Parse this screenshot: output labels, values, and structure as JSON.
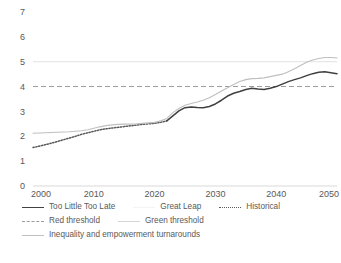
{
  "chart_data": {
    "type": "line",
    "title": "",
    "xlabel": "",
    "ylabel": "",
    "xlim": [
      2000,
      2050
    ],
    "ylim": [
      0,
      7
    ],
    "grid": false,
    "legend_position": "bottom",
    "xticks": [
      "2000",
      "2010",
      "2020",
      "2030",
      "2040",
      "2050"
    ],
    "yticks": [
      "0",
      "1",
      "2",
      "3",
      "4",
      "5",
      "6",
      "7"
    ],
    "x": [
      2000,
      2001,
      2002,
      2003,
      2004,
      2005,
      2006,
      2007,
      2008,
      2009,
      2010,
      2011,
      2012,
      2013,
      2014,
      2015,
      2016,
      2017,
      2018,
      2019,
      2020,
      2021,
      2022,
      2023,
      2024,
      2025,
      2026,
      2027,
      2028,
      2029,
      2030,
      2031,
      2032,
      2033,
      2034,
      2035,
      2036,
      2037,
      2038,
      2039,
      2040,
      2041,
      2042,
      2043,
      2044,
      2045,
      2046,
      2047,
      2048,
      2049,
      2050
    ],
    "series": [
      {
        "name": "Historical",
        "style": "dotted",
        "color": "#595959",
        "x": [
          2000,
          2001,
          2002,
          2003,
          2004,
          2005,
          2006,
          2007,
          2008,
          2009,
          2010,
          2011,
          2012,
          2013,
          2014,
          2015,
          2016,
          2017,
          2018,
          2019,
          2020,
          2021,
          2022
        ],
        "values": [
          1.55,
          1.6,
          1.66,
          1.72,
          1.79,
          1.86,
          1.93,
          2.0,
          2.08,
          2.14,
          2.2,
          2.26,
          2.3,
          2.33,
          2.36,
          2.39,
          2.42,
          2.45,
          2.48,
          2.5,
          2.52,
          2.56,
          2.62
        ]
      },
      {
        "name": "Too Little Too Late",
        "style": "solid",
        "color": "#404040",
        "x": [
          2022,
          2023,
          2024,
          2025,
          2026,
          2027,
          2028,
          2029,
          2030,
          2031,
          2032,
          2033,
          2034,
          2035,
          2036,
          2037,
          2038,
          2039,
          2040,
          2041,
          2042,
          2043,
          2044,
          2045,
          2046,
          2047,
          2048,
          2049,
          2050
        ],
        "values": [
          2.62,
          2.82,
          3.02,
          3.15,
          3.18,
          3.16,
          3.15,
          3.2,
          3.3,
          3.45,
          3.62,
          3.73,
          3.8,
          3.88,
          3.93,
          3.9,
          3.88,
          3.93,
          4.0,
          4.1,
          4.2,
          4.28,
          4.35,
          4.44,
          4.52,
          4.58,
          4.6,
          4.56,
          4.52
        ]
      },
      {
        "name": "Inequality and empowerment turnarounds",
        "style": "solid",
        "color": "#bfbfbf",
        "x": [
          2000,
          2001,
          2002,
          2003,
          2004,
          2005,
          2006,
          2007,
          2008,
          2009,
          2010,
          2011,
          2012,
          2013,
          2014,
          2015,
          2016,
          2017,
          2018,
          2019,
          2020,
          2021,
          2022,
          2023,
          2024,
          2025,
          2026,
          2027,
          2028,
          2029,
          2030,
          2031,
          2032,
          2033,
          2034,
          2035,
          2036,
          2037,
          2038,
          2039,
          2040,
          2041,
          2042,
          2043,
          2044,
          2045,
          2046,
          2047,
          2048,
          2049,
          2050
        ],
        "values": [
          2.12,
          2.13,
          2.14,
          2.15,
          2.16,
          2.17,
          2.18,
          2.2,
          2.22,
          2.26,
          2.32,
          2.38,
          2.43,
          2.46,
          2.48,
          2.49,
          2.49,
          2.5,
          2.52,
          2.54,
          2.56,
          2.62,
          2.72,
          2.95,
          3.12,
          3.25,
          3.32,
          3.38,
          3.45,
          3.55,
          3.68,
          3.82,
          3.95,
          4.08,
          4.2,
          4.28,
          4.32,
          4.33,
          4.35,
          4.4,
          4.45,
          4.5,
          4.6,
          4.72,
          4.85,
          4.98,
          5.07,
          5.13,
          5.17,
          5.17,
          5.15
        ]
      },
      {
        "name": "Great Leap",
        "style": "solid",
        "color": "#f2f2f2",
        "x": [],
        "values": []
      }
    ],
    "threshold_lines": [
      {
        "name": "Red threshold",
        "value": 4,
        "style": "dashed",
        "color": "#9c9c9c"
      },
      {
        "name": "Green threshold",
        "value": 5,
        "style": "solid",
        "color": "#e3e3e3"
      }
    ]
  },
  "axes": {
    "y_ticks": [
      "7",
      "6",
      "5",
      "4",
      "3",
      "2",
      "1",
      "0"
    ],
    "x_ticks": [
      "2000",
      "2010",
      "2020",
      "2030",
      "2040",
      "2050"
    ]
  },
  "legend": {
    "rows": [
      {
        "items": [
          {
            "label": "Too Little Too Late",
            "swatch": "solid-dark"
          },
          {
            "label": "Great Leap",
            "swatch": "solid-faint"
          },
          {
            "label": "Historical",
            "swatch": "dotted"
          }
        ]
      },
      {
        "items": [
          {
            "label": "Red threshold",
            "swatch": "dashed"
          },
          {
            "label": "Green threshold",
            "swatch": "solid-light"
          }
        ]
      },
      {
        "items": [
          {
            "label": "Inequality and empowerment turnarounds",
            "swatch": "solid-mid"
          }
        ]
      }
    ]
  }
}
